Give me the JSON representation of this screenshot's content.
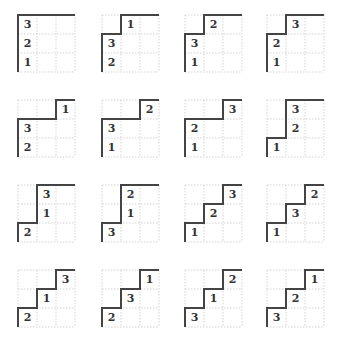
{
  "figure": {
    "cell_size": 19,
    "grid_origins_x": [
      18,
      102,
      185,
      267
    ],
    "grid_origins_y": [
      15,
      100,
      185,
      270
    ],
    "colors": {
      "grid_line": "#c8c8c8",
      "border": "#444444",
      "text": "#333333"
    }
  },
  "grids": [
    {
      "profile": [
        0,
        0,
        0
      ],
      "labels": [
        {
          "c": 0,
          "r": 0,
          "v": "3"
        },
        {
          "c": 0,
          "r": 1,
          "v": "2"
        },
        {
          "c": 0,
          "r": 2,
          "v": "1"
        }
      ]
    },
    {
      "profile": [
        1,
        0,
        0
      ],
      "labels": [
        {
          "c": 1,
          "r": 0,
          "v": "1"
        },
        {
          "c": 0,
          "r": 1,
          "v": "3"
        },
        {
          "c": 0,
          "r": 2,
          "v": "2"
        }
      ]
    },
    {
      "profile": [
        1,
        0,
        0
      ],
      "labels": [
        {
          "c": 1,
          "r": 0,
          "v": "2"
        },
        {
          "c": 0,
          "r": 1,
          "v": "3"
        },
        {
          "c": 0,
          "r": 2,
          "v": "1"
        }
      ]
    },
    {
      "profile": [
        1,
        0,
        0
      ],
      "labels": [
        {
          "c": 1,
          "r": 0,
          "v": "3"
        },
        {
          "c": 0,
          "r": 1,
          "v": "2"
        },
        {
          "c": 0,
          "r": 2,
          "v": "1"
        }
      ]
    },
    {
      "profile": [
        1,
        1,
        0
      ],
      "labels": [
        {
          "c": 2,
          "r": 0,
          "v": "1"
        },
        {
          "c": 0,
          "r": 1,
          "v": "3"
        },
        {
          "c": 0,
          "r": 2,
          "v": "2"
        }
      ]
    },
    {
      "profile": [
        1,
        1,
        0
      ],
      "labels": [
        {
          "c": 2,
          "r": 0,
          "v": "2"
        },
        {
          "c": 0,
          "r": 1,
          "v": "3"
        },
        {
          "c": 0,
          "r": 2,
          "v": "1"
        }
      ]
    },
    {
      "profile": [
        1,
        1,
        0
      ],
      "labels": [
        {
          "c": 2,
          "r": 0,
          "v": "3"
        },
        {
          "c": 0,
          "r": 1,
          "v": "2"
        },
        {
          "c": 0,
          "r": 2,
          "v": "1"
        }
      ]
    },
    {
      "profile": [
        2,
        0,
        0
      ],
      "labels": [
        {
          "c": 1,
          "r": 0,
          "v": "3"
        },
        {
          "c": 1,
          "r": 1,
          "v": "2"
        },
        {
          "c": 0,
          "r": 2,
          "v": "1"
        }
      ]
    },
    {
      "profile": [
        2,
        0,
        0
      ],
      "labels": [
        {
          "c": 1,
          "r": 0,
          "v": "3"
        },
        {
          "c": 1,
          "r": 1,
          "v": "1"
        },
        {
          "c": 0,
          "r": 2,
          "v": "2"
        }
      ]
    },
    {
      "profile": [
        2,
        0,
        0
      ],
      "labels": [
        {
          "c": 1,
          "r": 0,
          "v": "2"
        },
        {
          "c": 1,
          "r": 1,
          "v": "1"
        },
        {
          "c": 0,
          "r": 2,
          "v": "3"
        }
      ]
    },
    {
      "profile": [
        2,
        1,
        0
      ],
      "labels": [
        {
          "c": 2,
          "r": 0,
          "v": "3"
        },
        {
          "c": 1,
          "r": 1,
          "v": "2"
        },
        {
          "c": 0,
          "r": 2,
          "v": "1"
        }
      ]
    },
    {
      "profile": [
        2,
        1,
        0
      ],
      "labels": [
        {
          "c": 2,
          "r": 0,
          "v": "2"
        },
        {
          "c": 1,
          "r": 1,
          "v": "3"
        },
        {
          "c": 0,
          "r": 2,
          "v": "1"
        }
      ]
    },
    {
      "profile": [
        2,
        1,
        0
      ],
      "labels": [
        {
          "c": 2,
          "r": 0,
          "v": "3"
        },
        {
          "c": 1,
          "r": 1,
          "v": "1"
        },
        {
          "c": 0,
          "r": 2,
          "v": "2"
        }
      ]
    },
    {
      "profile": [
        2,
        1,
        0
      ],
      "labels": [
        {
          "c": 2,
          "r": 0,
          "v": "1"
        },
        {
          "c": 1,
          "r": 1,
          "v": "3"
        },
        {
          "c": 0,
          "r": 2,
          "v": "2"
        }
      ]
    },
    {
      "profile": [
        2,
        1,
        0
      ],
      "labels": [
        {
          "c": 2,
          "r": 0,
          "v": "2"
        },
        {
          "c": 1,
          "r": 1,
          "v": "1"
        },
        {
          "c": 0,
          "r": 2,
          "v": "3"
        }
      ]
    },
    {
      "profile": [
        2,
        1,
        0
      ],
      "labels": [
        {
          "c": 2,
          "r": 0,
          "v": "1"
        },
        {
          "c": 1,
          "r": 1,
          "v": "2"
        },
        {
          "c": 0,
          "r": 2,
          "v": "3"
        }
      ]
    }
  ]
}
